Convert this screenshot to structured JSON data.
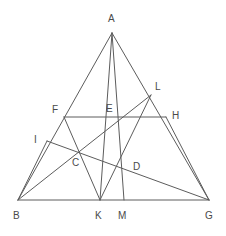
{
  "figure": {
    "type": "geometry-diagram",
    "background_color": "#ffffff",
    "line_color": "#5c5c5c",
    "label_color": "#4a4a4a",
    "canvas": {
      "width": 226,
      "height": 236
    }
  },
  "points": [
    {
      "id": "A",
      "label": "A",
      "x": 112,
      "y": 33,
      "label_x": 108,
      "label_y": 14
    },
    {
      "id": "B",
      "label": "B",
      "x": 18,
      "y": 200,
      "label_x": 13,
      "label_y": 211
    },
    {
      "id": "G",
      "label": "G",
      "x": 209,
      "y": 200,
      "label_x": 205,
      "label_y": 211
    },
    {
      "id": "F",
      "label": "F",
      "x": 64,
      "y": 117,
      "label_x": 52,
      "label_y": 105
    },
    {
      "id": "E",
      "label": "E",
      "x": 119,
      "y": 117,
      "label_x": 106,
      "label_y": 104
    },
    {
      "id": "H",
      "label": "H",
      "x": 166,
      "y": 117,
      "label_x": 172,
      "label_y": 111
    },
    {
      "id": "L",
      "label": "L",
      "x": 151,
      "y": 95,
      "label_x": 155,
      "label_y": 82
    },
    {
      "id": "I",
      "label": "I",
      "x": 47,
      "y": 141,
      "label_x": 34,
      "label_y": 135
    },
    {
      "id": "C",
      "label": "C",
      "x": 78,
      "y": 152,
      "label_x": 72,
      "label_y": 158
    },
    {
      "id": "D",
      "label": "D",
      "x": 124,
      "y": 170,
      "label_x": 133,
      "label_y": 162
    },
    {
      "id": "K",
      "label": "K",
      "x": 100,
      "y": 200,
      "label_x": 95,
      "label_y": 211
    },
    {
      "id": "M",
      "label": "M",
      "x": 124,
      "y": 200,
      "label_x": 118,
      "label_y": 211
    }
  ],
  "segments": [
    {
      "id": "AB",
      "name": "side-ab",
      "from": "A",
      "to": "B"
    },
    {
      "id": "AG",
      "name": "side-ag",
      "from": "A",
      "to": "G"
    },
    {
      "id": "BG",
      "name": "base-bg",
      "from": "B",
      "to": "G"
    },
    {
      "id": "AM",
      "name": "cevian-a-to-m",
      "from": "A",
      "to": "M"
    },
    {
      "id": "AK",
      "name": "cevian-a-to-k",
      "from": "A",
      "to": "K"
    },
    {
      "id": "FH",
      "name": "transversal-f-to-h",
      "from": "F",
      "to": "H"
    },
    {
      "id": "BL",
      "name": "line-b-through-c-e-to-l",
      "from": "B",
      "to": "L"
    },
    {
      "id": "IG",
      "name": "line-i-through-c-d-to-g",
      "from": "I",
      "to": "G"
    },
    {
      "id": "FK",
      "name": "line-f-through-c-to-k",
      "from": "F",
      "to": "K"
    },
    {
      "id": "LK",
      "name": "line-l-through-h-d-to-k",
      "from": "L",
      "to": "K"
    },
    {
      "id": "BI",
      "name": "segment-b-to-i",
      "from": "B",
      "to": "I"
    },
    {
      "id": "HG",
      "name": "segment-h-to-g",
      "from": "H",
      "to": "G"
    }
  ]
}
